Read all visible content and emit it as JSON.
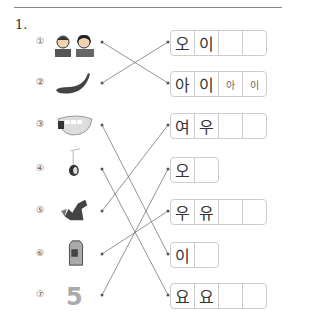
{
  "question_number": "1.",
  "left_items": [
    {
      "label": "①",
      "picture": "boy-and-girl-icon",
      "y": 42
    },
    {
      "label": "②",
      "picture": "cucumber-icon",
      "y": 83
    },
    {
      "label": "③",
      "picture": "teeth-icon",
      "y": 125
    },
    {
      "label": "④",
      "picture": "yoyo-icon",
      "y": 169
    },
    {
      "label": "⑤",
      "picture": "fox-icon",
      "y": 211
    },
    {
      "label": "⑥",
      "picture": "milk-carton-icon",
      "y": 254
    },
    {
      "label": "⑦",
      "picture": "number-five",
      "y": 295,
      "text": "5"
    }
  ],
  "right_boxes": [
    {
      "cells": [
        "오",
        "이",
        "",
        ""
      ],
      "y": 42
    },
    {
      "cells": [
        "아",
        "이",
        "아",
        "이"
      ],
      "y": 83
    },
    {
      "cells": [
        "여",
        "우",
        "",
        ""
      ],
      "y": 125
    },
    {
      "cells": [
        "오",
        ""
      ],
      "y": 169
    },
    {
      "cells": [
        "우",
        "유",
        "",
        ""
      ],
      "y": 211
    },
    {
      "cells": [
        "이",
        ""
      ],
      "y": 254
    },
    {
      "cells": [
        "요",
        "요",
        "",
        ""
      ],
      "y": 295
    }
  ],
  "connections": [
    {
      "from": 1,
      "to": 2
    },
    {
      "from": 2,
      "to": 1
    },
    {
      "from": 3,
      "to": 6
    },
    {
      "from": 4,
      "to": 7
    },
    {
      "from": 5,
      "to": 3
    },
    {
      "from": 6,
      "to": 5
    },
    {
      "from": 7,
      "to": 4
    }
  ]
}
